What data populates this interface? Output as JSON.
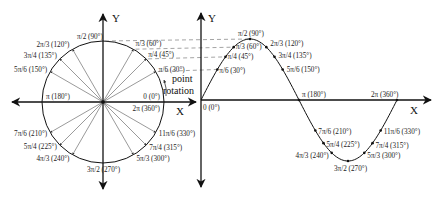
{
  "diagram": {
    "axes": {
      "left_y_label": "Y",
      "left_x_label": "X",
      "right_y_label": "Y",
      "right_x_label": "X"
    },
    "annotation": {
      "line1": "point",
      "line2": "rotation"
    },
    "circle_labels": [
      {
        "angle": 90,
        "text": "π/2 (90°)"
      },
      {
        "angle": 60,
        "text": "π/3 (60°)"
      },
      {
        "angle": 45,
        "text": "π/4 (45°)"
      },
      {
        "angle": 30,
        "text": "π/6 (30°)"
      },
      {
        "angle": 0,
        "text": "0 (0°)"
      },
      {
        "angle": 360,
        "text": "2π (360°)"
      },
      {
        "angle": 120,
        "text": "2π/3 (120°)"
      },
      {
        "angle": 135,
        "text": "3π/4 (135°)"
      },
      {
        "angle": 150,
        "text": "5π/6 (150°)"
      },
      {
        "angle": 180,
        "text": "π (180°)"
      },
      {
        "angle": 210,
        "text": "7π/6 (210°)"
      },
      {
        "angle": 225,
        "text": "5π/4 (225°)"
      },
      {
        "angle": 240,
        "text": "4π/3 (240°)"
      },
      {
        "angle": 270,
        "text": "3π/2 (270°)"
      },
      {
        "angle": 300,
        "text": "5π/3 (300°)"
      },
      {
        "angle": 315,
        "text": "7π/4 (315°)"
      },
      {
        "angle": 330,
        "text": "11π/6 (330°)"
      }
    ],
    "wave_labels": [
      {
        "angle": 0,
        "text": "0 (0°)"
      },
      {
        "angle": 30,
        "text": "π/6 (30°)"
      },
      {
        "angle": 45,
        "text": "π/4 (45°)"
      },
      {
        "angle": 60,
        "text": "π/3 (60°)"
      },
      {
        "angle": 90,
        "text": "π/2 (90°)"
      },
      {
        "angle": 120,
        "text": "2π/3 (120°)"
      },
      {
        "angle": 135,
        "text": "3π/4 (135°)"
      },
      {
        "angle": 150,
        "text": "5π/6 (150°)"
      },
      {
        "angle": 180,
        "text": "π (180°)"
      },
      {
        "angle": 210,
        "text": "7π/6 (210°)"
      },
      {
        "angle": 225,
        "text": "5π/4 (225°)"
      },
      {
        "angle": 240,
        "text": "4π/3 (240°)"
      },
      {
        "angle": 270,
        "text": "3π/2 (270°)"
      },
      {
        "angle": 300,
        "text": "5π/3 (300°)"
      },
      {
        "angle": 315,
        "text": "7π/4 (315°)"
      },
      {
        "angle": 330,
        "text": "11π/6 (330°)"
      },
      {
        "angle": 360,
        "text": "2π (360°)"
      }
    ],
    "colors": {
      "line": "#111111",
      "spoke": "#555555",
      "dash": "#666666"
    }
  }
}
